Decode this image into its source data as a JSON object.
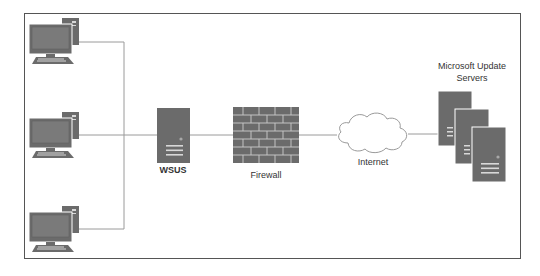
{
  "diagram": {
    "type": "network-topology",
    "colors": {
      "device_fill": "#6b6b6b",
      "device_detail": "#d8d8d8",
      "connector": "#9a9a9a",
      "frame_border": "#555555",
      "cloud_stroke": "#9a9a9a",
      "label_text": "#333333"
    },
    "nodes": [
      {
        "id": "client-1",
        "kind": "computer",
        "label": ""
      },
      {
        "id": "client-2",
        "kind": "computer",
        "label": ""
      },
      {
        "id": "client-3",
        "kind": "computer",
        "label": ""
      },
      {
        "id": "wsus",
        "kind": "server",
        "label": "WSUS"
      },
      {
        "id": "firewall",
        "kind": "firewall",
        "label": "Firewall"
      },
      {
        "id": "internet",
        "kind": "cloud",
        "label": "Internet"
      },
      {
        "id": "ms-update",
        "kind": "server-stack",
        "label_line1": "Microsoft Update",
        "label_line2": "Servers"
      }
    ],
    "edges": [
      {
        "from": "client-1",
        "to": "wsus"
      },
      {
        "from": "client-2",
        "to": "wsus"
      },
      {
        "from": "client-3",
        "to": "wsus"
      },
      {
        "from": "wsus",
        "to": "firewall"
      },
      {
        "from": "firewall",
        "to": "internet"
      },
      {
        "from": "internet",
        "to": "ms-update"
      }
    ]
  },
  "labels": {
    "wsus": "WSUS",
    "firewall": "Firewall",
    "internet": "Internet",
    "ms_update_line1": "Microsoft Update",
    "ms_update_line2": "Servers"
  }
}
